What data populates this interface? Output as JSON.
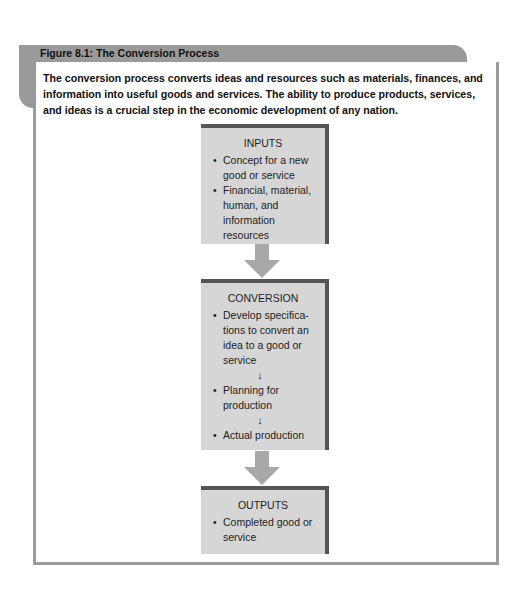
{
  "figure": {
    "title": "Figure 8.1: The Conversion Process",
    "caption": "The conversion process converts ideas and resources such as materials, finances, and information into useful goods and services. The ability to produce products, services, and ideas is a crucial step in the economic development of any nation."
  },
  "diagram": {
    "inputs": {
      "title": "INPUTS",
      "items": [
        "Concept for a new good or service",
        "Financial, material, human, and information resources"
      ]
    },
    "conversion": {
      "title": "CONVERSION",
      "items": [
        "Develop specifica-tions to convert an idea to a good or service",
        "Planning for production",
        "Actual production"
      ],
      "step_arrow_glyph": "↓"
    },
    "outputs": {
      "title": "OUTPUTS",
      "items": [
        "Completed good or service"
      ]
    },
    "colors": {
      "box_fill": "#d6d6d6",
      "box_shadow": "#555555",
      "arrow": "#a8a8a8",
      "frame": "#9a9a9a"
    }
  }
}
